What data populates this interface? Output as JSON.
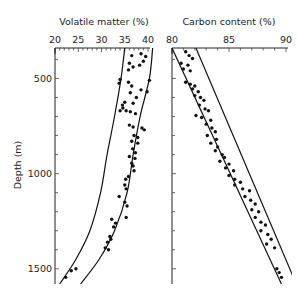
{
  "chart_data": [
    {
      "type": "scatter",
      "panel": "left",
      "title": "Volatile matter (%)",
      "xlabel": "Volatile matter (%)",
      "ylabel": "Depth (m)",
      "x_ticks": [
        20,
        25,
        30,
        35,
        40
      ],
      "y_ticks": [
        500,
        1000,
        1500
      ],
      "xlim": [
        20,
        41
      ],
      "ylim": [
        1580,
        340
      ],
      "x_axis_position": "top",
      "y_inverted": true,
      "grid": false,
      "envelope_curves": [
        {
          "name": "left-bound",
          "points": [
            [
              35.0,
              340
            ],
            [
              34.2,
              500
            ],
            [
              32.8,
              700
            ],
            [
              31.2,
              900
            ],
            [
              29.8,
              1100
            ],
            [
              27.5,
              1300
            ],
            [
              24.5,
              1450
            ],
            [
              21.0,
              1580
            ]
          ]
        },
        {
          "name": "right-bound",
          "points": [
            [
              41.0,
              340
            ],
            [
              40.3,
              500
            ],
            [
              38.3,
              700
            ],
            [
              36.8,
              900
            ],
            [
              35.5,
              1100
            ],
            [
              32.8,
              1300
            ],
            [
              29.5,
              1450
            ],
            [
              25.5,
              1580
            ]
          ]
        }
      ],
      "points": [
        [
          36.5,
          380
        ],
        [
          38.5,
          370
        ],
        [
          39.5,
          385
        ],
        [
          36.0,
          420
        ],
        [
          39.0,
          410
        ],
        [
          38.2,
          430
        ],
        [
          36.8,
          440
        ],
        [
          35.8,
          455
        ],
        [
          34.0,
          505
        ],
        [
          33.8,
          525
        ],
        [
          35.8,
          520
        ],
        [
          36.5,
          540
        ],
        [
          38.5,
          560
        ],
        [
          39.8,
          570
        ],
        [
          40.3,
          510
        ],
        [
          36.2,
          575
        ],
        [
          37.5,
          600
        ],
        [
          35.0,
          625
        ],
        [
          34.5,
          640
        ],
        [
          36.8,
          630
        ],
        [
          34.6,
          655
        ],
        [
          34.0,
          670
        ],
        [
          35.3,
          670
        ],
        [
          36.2,
          675
        ],
        [
          37.3,
          685
        ],
        [
          36.0,
          745
        ],
        [
          36.8,
          755
        ],
        [
          38.7,
          760
        ],
        [
          39.2,
          770
        ],
        [
          37.0,
          800
        ],
        [
          37.8,
          810
        ],
        [
          36.5,
          830
        ],
        [
          37.8,
          840
        ],
        [
          36.7,
          870
        ],
        [
          37.3,
          890
        ],
        [
          36.0,
          910
        ],
        [
          37.2,
          920
        ],
        [
          36.5,
          945
        ],
        [
          36.8,
          960
        ],
        [
          37.0,
          985
        ],
        [
          35.8,
          1015
        ],
        [
          35.2,
          1030
        ],
        [
          35.0,
          1060
        ],
        [
          35.3,
          1080
        ],
        [
          33.8,
          1120
        ],
        [
          35.0,
          1150
        ],
        [
          35.5,
          1170
        ],
        [
          35.3,
          1230
        ],
        [
          32.2,
          1240
        ],
        [
          33.0,
          1260
        ],
        [
          32.6,
          1280
        ],
        [
          31.8,
          1330
        ],
        [
          32.0,
          1345
        ],
        [
          31.3,
          1360
        ],
        [
          30.8,
          1390
        ],
        [
          31.5,
          1400
        ],
        [
          24.5,
          1500
        ],
        [
          23.5,
          1510
        ],
        [
          22.3,
          1545
        ]
      ]
    },
    {
      "type": "scatter",
      "panel": "right",
      "title": "Carbon content (%)",
      "xlabel": "Carbon content (%)",
      "ylabel": "Depth (m)",
      "x_ticks": [
        80,
        85,
        90
      ],
      "xlim": [
        80,
        90
      ],
      "ylim": [
        1580,
        340
      ],
      "x_axis_position": "top",
      "y_inverted": true,
      "grid": false,
      "envelope_curves": [
        {
          "name": "left-bound",
          "points": [
            [
              80.0,
              340
            ],
            [
              89.6,
              1580
            ]
          ]
        },
        {
          "name": "right-bound",
          "points": [
            [
              82.1,
              340
            ],
            [
              90.9,
              1580
            ]
          ]
        }
      ],
      "points": [
        [
          81.2,
          360
        ],
        [
          81.5,
          380
        ],
        [
          81.8,
          395
        ],
        [
          80.8,
          420
        ],
        [
          81.4,
          430
        ],
        [
          81.0,
          450
        ],
        [
          81.6,
          460
        ],
        [
          81.2,
          520
        ],
        [
          81.6,
          530
        ],
        [
          82.0,
          540
        ],
        [
          81.8,
          555
        ],
        [
          82.3,
          570
        ],
        [
          82.0,
          590
        ],
        [
          82.5,
          600
        ],
        [
          82.8,
          615
        ],
        [
          82.4,
          640
        ],
        [
          82.9,
          660
        ],
        [
          83.2,
          670
        ],
        [
          82.1,
          695
        ],
        [
          82.6,
          705
        ],
        [
          83.4,
          720
        ],
        [
          83.0,
          740
        ],
        [
          83.5,
          760
        ],
        [
          83.8,
          780
        ],
        [
          83.1,
          800
        ],
        [
          83.9,
          820
        ],
        [
          83.4,
          840
        ],
        [
          84.0,
          860
        ],
        [
          83.8,
          880
        ],
        [
          84.4,
          900
        ],
        [
          84.6,
          915
        ],
        [
          84.2,
          935
        ],
        [
          85.0,
          950
        ],
        [
          84.7,
          970
        ],
        [
          85.4,
          985
        ],
        [
          85.0,
          1010
        ],
        [
          85.5,
          1030
        ],
        [
          86.0,
          1045
        ],
        [
          85.5,
          1060
        ],
        [
          86.2,
          1080
        ],
        [
          86.8,
          1090
        ],
        [
          86.4,
          1120
        ],
        [
          86.9,
          1140
        ],
        [
          87.3,
          1160
        ],
        [
          87.0,
          1190
        ],
        [
          87.6,
          1200
        ],
        [
          87.3,
          1230
        ],
        [
          87.8,
          1255
        ],
        [
          88.2,
          1270
        ],
        [
          87.8,
          1300
        ],
        [
          88.4,
          1320
        ],
        [
          88.7,
          1345
        ],
        [
          88.3,
          1370
        ],
        [
          89.0,
          1390
        ],
        [
          89.2,
          1500
        ],
        [
          89.4,
          1520
        ],
        [
          89.6,
          1545
        ]
      ]
    }
  ],
  "labels": {
    "left_title": "Volatile matter (%)",
    "right_title": "Carbon content (%)",
    "y_title": "Depth (m)",
    "left_ticks": [
      "20",
      "25",
      "30",
      "35",
      "40"
    ],
    "right_ticks": [
      "80",
      "85",
      "90"
    ],
    "depth_ticks": [
      "500",
      "1000",
      "1500"
    ]
  }
}
